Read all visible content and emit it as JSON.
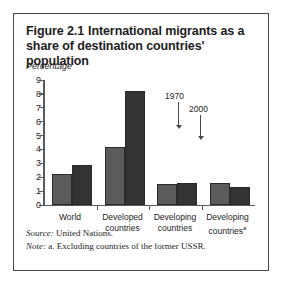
{
  "figure": {
    "number": "Figure 2.1",
    "title": "International migrants as a share of destination countries' population"
  },
  "axis_unit_label": "Percentage",
  "notes": {
    "source_key": "Source:",
    "source_text": "United Nations.",
    "note_key": "Note:",
    "note_text": "a. Excluding countries of the former USSR."
  },
  "annotations": {
    "label_1970": "1970",
    "label_2000": "2000"
  },
  "colors": {
    "series_1970": "#5b5b5b",
    "series_2000": "#333333",
    "axis": "#5a5a5a",
    "border": "#4a4a4a",
    "text": "#1d1d1d"
  },
  "chart_data": {
    "type": "bar",
    "subtitle": "",
    "xlabel": "",
    "ylabel": "Percentage",
    "ylim": [
      0,
      9
    ],
    "yticks": [
      0,
      1,
      2,
      3,
      4,
      5,
      6,
      7,
      8,
      9
    ],
    "ytick_labels": [
      "0",
      "1",
      "2",
      "3",
      "4",
      "5",
      "6",
      "7",
      "8",
      "9"
    ],
    "grid": false,
    "legend": "none",
    "categories": [
      "World",
      "Developed countries",
      "Developing countries",
      "Developing countriesᵃ"
    ],
    "category_lines": [
      [
        "World"
      ],
      [
        "Developed",
        "countries"
      ],
      [
        "Developing",
        "countries"
      ],
      [
        "Developing",
        "countries",
        "a"
      ]
    ],
    "series": [
      {
        "name": "1970",
        "values": [
          2.2,
          4.2,
          1.5,
          1.6
        ]
      },
      {
        "name": "2000",
        "values": [
          2.9,
          8.2,
          1.6,
          1.3
        ]
      }
    ],
    "annotations": [
      {
        "text": "1970",
        "points_to": "Developing countriesᵃ / 1970 bar"
      },
      {
        "text": "2000",
        "points_to": "Developing countriesᵃ / 2000 bar"
      }
    ],
    "footnote": "a. Excluding countries of the former USSR.",
    "source": "United Nations."
  }
}
